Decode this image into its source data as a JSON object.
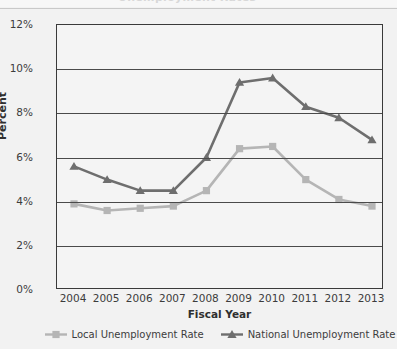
{
  "chart_data": {
    "type": "line",
    "title": "",
    "xlabel": "Fiscal Year",
    "ylabel": "Percent",
    "categories": [
      "2004",
      "2005",
      "2006",
      "2007",
      "2008",
      "2009",
      "2010",
      "2011",
      "2012",
      "2013"
    ],
    "ylim": [
      0,
      12
    ],
    "yticks": [
      "0%",
      "2%",
      "4%",
      "6%",
      "8%",
      "10%",
      "12%"
    ],
    "ytick_values": [
      0,
      2,
      4,
      6,
      8,
      10,
      12
    ],
    "grid": true,
    "legend_position": "bottom",
    "series": [
      {
        "name": "Local Unemployment Rate",
        "color": "#b5b5b5",
        "marker": "square",
        "values": [
          3.9,
          3.6,
          3.7,
          3.8,
          4.5,
          6.4,
          6.5,
          5.0,
          4.1,
          3.8
        ]
      },
      {
        "name": "National Unemployment Rate",
        "color": "#6e6e6e",
        "marker": "triangle",
        "values": [
          5.6,
          5.0,
          4.5,
          4.5,
          6.0,
          9.4,
          9.6,
          8.3,
          7.8,
          6.8
        ]
      }
    ]
  },
  "clipped_title": "Unemployment Rates",
  "colors": {
    "local": "#b5b5b5",
    "national": "#6e6e6e",
    "axis": "#3a3a3a",
    "grid": "#4a4a4a",
    "background": "#f2f2f2",
    "plot_background": "#f4f4f4",
    "text": "#3c3c3c"
  }
}
